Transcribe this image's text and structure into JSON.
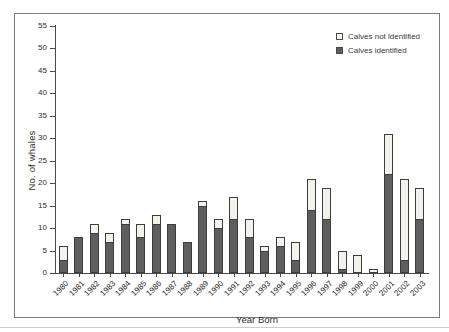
{
  "chart_data": {
    "type": "bar",
    "stacked": true,
    "title": "",
    "xlabel": "Year Born",
    "ylabel": "No. of whales",
    "ylim": [
      0,
      55
    ],
    "ytick_step": 5,
    "grid": false,
    "legend_position": "top-right",
    "categories": [
      "1980",
      "1981",
      "1982",
      "1983",
      "1984",
      "1985",
      "1986",
      "1987",
      "1988",
      "1989",
      "1990",
      "1991",
      "1992",
      "1993",
      "1994",
      "1995",
      "1996",
      "1997",
      "1998",
      "1999",
      "2000",
      "2001",
      "2002",
      "2003"
    ],
    "series": [
      {
        "name": "Calves identified",
        "color": "#5e5e5e",
        "values": [
          3,
          8,
          9,
          7,
          11,
          8,
          11,
          11,
          7,
          15,
          10,
          12,
          8,
          5,
          6,
          3,
          14,
          12,
          1,
          0,
          0,
          22,
          3,
          12
        ]
      },
      {
        "name": "Calves not identified",
        "color": "#f3f3ee",
        "values": [
          3,
          0,
          2,
          2,
          1,
          3,
          2,
          0,
          0,
          1,
          2,
          5,
          4,
          1,
          2,
          4,
          7,
          7,
          4,
          4,
          1,
          9,
          18,
          7
        ]
      }
    ],
    "totals": [
      6,
      8,
      11,
      9,
      12,
      11,
      13,
      11,
      7,
      16,
      12,
      17,
      12,
      6,
      8,
      7,
      21,
      19,
      5,
      4,
      1,
      31,
      21,
      19
    ]
  },
  "colors": {
    "axis": "#4a4a4a",
    "bar_border": "#3d3d3d",
    "identified_fill": "#5e5e5e",
    "not_identified_fill": "#f3f3ee",
    "frame_border": "#7a7a7a",
    "text": "#2e2e2e"
  }
}
